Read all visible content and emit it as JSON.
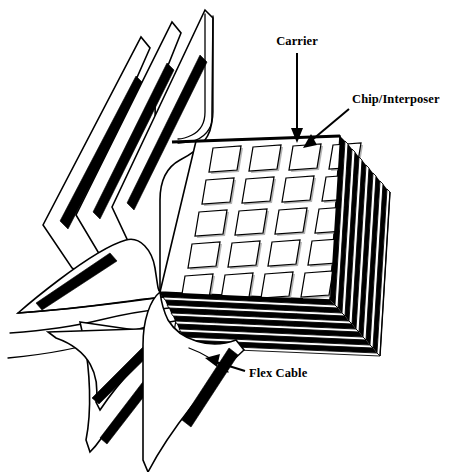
{
  "figure": {
    "background_color": "#ffffff",
    "line_color": "#000000",
    "width": 450,
    "height": 472
  },
  "labels": [
    {
      "id": "carrier",
      "text": "Carrier",
      "x": 297,
      "y": 45,
      "anchor": "middle",
      "arrow": {
        "from_x": 297,
        "from_y": 52,
        "to_x": 297,
        "to_y": 141,
        "style": "straight-down"
      }
    },
    {
      "id": "chip-interposer",
      "text": "Chip/Interposer",
      "x": 352,
      "y": 103,
      "anchor": "start",
      "arrow": {
        "from_x": 350,
        "from_y": 108,
        "to_x": 306,
        "to_y": 145,
        "style": "diagonal-down-left"
      }
    },
    {
      "id": "flex-cable",
      "text": "Flex Cable",
      "x": 249,
      "y": 377,
      "anchor": "start",
      "arrow": {
        "from_x": 245,
        "from_y": 371,
        "to_x": 209,
        "to_y": 360,
        "style": "diagonal-up-left"
      }
    }
  ],
  "chip_array": {
    "rows": 6,
    "columns": 4,
    "total_chips": 24,
    "shape": "parallelogram",
    "fill_color": "#ffffff",
    "outline_color": "#000000",
    "shadow_color": "#9a9a9a"
  },
  "carrier_stack": {
    "layer_count": 8,
    "description": "Stacked carrier plates seen edge-on along right and bottom edges",
    "dark_color": "#000000",
    "light_color": "#ffffff"
  },
  "flex_cables": {
    "upper_sheet_count": 3,
    "lower_sheet_count": 3,
    "trace_color": "#000000",
    "sheet_fill": "#ffffff",
    "description": "Folded flex cable sheets fanning out from the carrier stack with thick conductive traces"
  }
}
